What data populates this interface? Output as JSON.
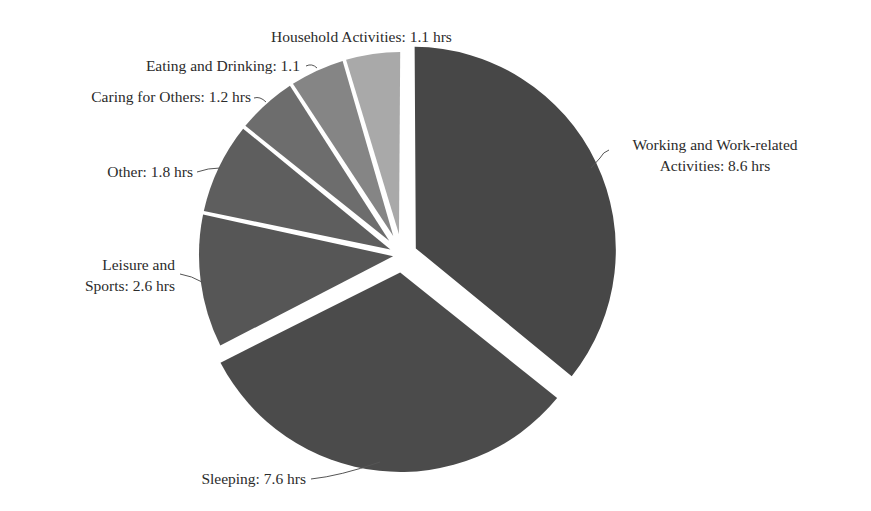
{
  "chart_data": {
    "type": "pie",
    "title": "",
    "unit": "hrs",
    "start_angle_deg": 0,
    "direction": "clockwise",
    "slices": [
      {
        "label": "Working and Work-related Activities",
        "value": 8.6,
        "display": [
          "Working and Work-related",
          "Activities: 8.6 hrs"
        ],
        "color": "#474747",
        "explode": 12
      },
      {
        "label": "Sleeping",
        "value": 7.6,
        "display": [
          "Sleeping: 7.6 hrs"
        ],
        "color": "#4b4b4b",
        "explode": 14
      },
      {
        "label": "Leisure and Sports",
        "value": 2.6,
        "display": [
          "Leisure and",
          "Sports: 2.6 hrs"
        ],
        "color": "#565656",
        "explode": 0
      },
      {
        "label": "Other",
        "value": 1.8,
        "display": [
          "Other: 1.8 hrs"
        ],
        "color": "#5e5e5e",
        "explode": 0
      },
      {
        "label": "Caring for Others",
        "value": 1.2,
        "display": [
          "Caring for Others: 1.2 hrs"
        ],
        "color": "#6d6d6d",
        "explode": 0
      },
      {
        "label": "Eating and Drinking",
        "value": 1.1,
        "display": [
          "Eating and Drinking: 1.1"
        ],
        "color": "#858585",
        "explode": 0
      },
      {
        "label": "Household Activities",
        "value": 1.1,
        "display": [
          "Household Activities: 1.1 hrs"
        ],
        "color": "#a9a9a9",
        "explode": 0
      }
    ],
    "total": 24.0,
    "legend": "none (direct labels with leader lines)"
  },
  "layout": {
    "cx": 402,
    "cy": 255,
    "r": 203,
    "gap": 6
  },
  "labels": [
    {
      "lines": [
        "Working and Work-related",
        "Activities: 8.6 hrs"
      ],
      "x": 715,
      "y": 150,
      "anchor": "middle",
      "leader": "M 591 168 L 600 158 Q 603 152 609 150"
    },
    {
      "lines": [
        "Sleeping: 7.6 hrs"
      ],
      "x": 306,
      "y": 484,
      "anchor": "end",
      "leader": "M 311 479 Q 340 476 380 462"
    },
    {
      "lines": [
        "Leisure and",
        "Sports: 2.6 hrs"
      ],
      "x": 175,
      "y": 270,
      "anchor": "end",
      "leader": "M 180 274 Q 192 276 202 282"
    },
    {
      "lines": [
        "Other: 1.8 hrs"
      ],
      "x": 193,
      "y": 177,
      "anchor": "end",
      "leader": "M 197 172 Q 208 168 220 168"
    },
    {
      "lines": [
        "Caring for Others: 1.2 hrs"
      ],
      "x": 251,
      "y": 102,
      "anchor": "end",
      "leader": "M 254 98 Q 260 96 266 102"
    },
    {
      "lines": [
        "Eating and Drinking: 1.1"
      ],
      "x": 300,
      "y": 71,
      "anchor": "end",
      "leader": "M 306 66 Q 312 63 317 68"
    },
    {
      "lines": [
        "Household Activities: 1.1 hrs"
      ],
      "x": 271,
      "y": 42,
      "anchor": "start",
      "leader": ""
    }
  ]
}
